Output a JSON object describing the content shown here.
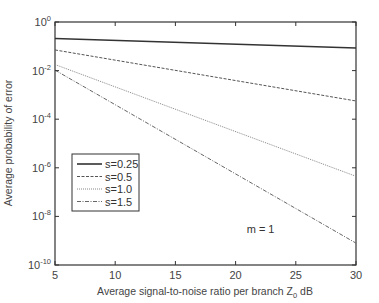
{
  "chart_data": {
    "type": "line",
    "title": "",
    "xlabel": "Average signal-to-noise ratio per branch Z",
    "xlabel_subscript": "0",
    "xlabel_suffix": " dB",
    "ylabel": "Average probability of error",
    "xlim": [
      5,
      30
    ],
    "ylim_log10": [
      -10,
      0
    ],
    "yscale": "log",
    "grid": false,
    "legend_position": "lower-left",
    "x_ticks": [
      5,
      10,
      15,
      20,
      25,
      30
    ],
    "x_tick_labels": [
      "5",
      "10",
      "15",
      "20",
      "25",
      "30"
    ],
    "y_ticks_log10": [
      0,
      -2,
      -4,
      -6,
      -8,
      -10
    ],
    "y_tick_labels": [
      {
        "base": "10",
        "exp": "0"
      },
      {
        "base": "10",
        "exp": "-2"
      },
      {
        "base": "10",
        "exp": "-4"
      },
      {
        "base": "10",
        "exp": "-6"
      },
      {
        "base": "10",
        "exp": "-8"
      },
      {
        "base": "10",
        "exp": "-10"
      }
    ],
    "x": [
      5,
      30
    ],
    "series": [
      {
        "name": "s=0.25",
        "style": "solid",
        "color": "#333333",
        "log10_values": [
          -0.68,
          -1.07
        ]
      },
      {
        "name": "s=0.5",
        "style": "dashed",
        "color": "#555555",
        "log10_values": [
          -1.15,
          -3.25
        ]
      },
      {
        "name": "s=1.0",
        "style": "dotted",
        "color": "#888888",
        "log10_values": [
          -1.75,
          -6.35
        ]
      },
      {
        "name": "s=1.5",
        "style": "dashdot",
        "color": "#666666",
        "log10_values": [
          -1.98,
          -9.1
        ]
      }
    ],
    "annotations": [
      {
        "text": "m = 1",
        "x": 22,
        "y_log10": -8.5
      }
    ]
  }
}
